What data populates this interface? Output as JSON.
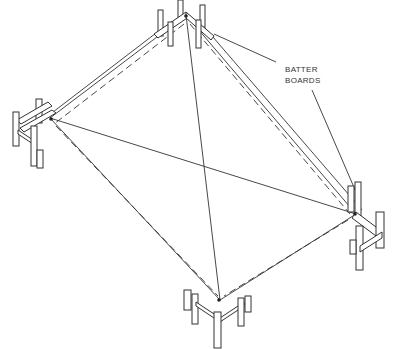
{
  "diagram": {
    "labels": {
      "line1": "BATTER",
      "line2": "BOARDS"
    },
    "corners": [
      "top",
      "left",
      "right",
      "bottom"
    ]
  }
}
